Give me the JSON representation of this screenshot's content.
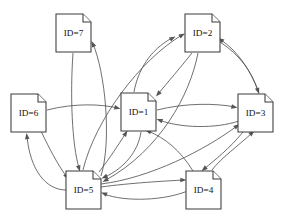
{
  "diagram": {
    "background_color": "#ffffff",
    "node_fill": "#ffffff",
    "node_stroke": "#3a3a3a",
    "edge_stroke": "#555555",
    "label_color": "#111111",
    "node_shape": "document-page-with-folded-corner",
    "width": 282,
    "height": 222,
    "nodes": [
      {
        "id": "7",
        "label": "ID=7",
        "x": 56,
        "y": 14,
        "w": 35,
        "h": 38
      },
      {
        "id": "2",
        "label": "ID=2",
        "x": 185,
        "y": 14,
        "w": 35,
        "h": 38
      },
      {
        "id": "6",
        "label": "ID=6",
        "x": 11,
        "y": 94,
        "w": 35,
        "h": 38
      },
      {
        "id": "1",
        "label": "ID=1",
        "x": 121,
        "y": 93,
        "w": 35,
        "h": 38
      },
      {
        "id": "3",
        "label": "ID=3",
        "x": 238,
        "y": 94,
        "w": 35,
        "h": 38
      },
      {
        "id": "5",
        "label": "ID=5",
        "x": 66,
        "y": 171,
        "w": 35,
        "h": 38
      },
      {
        "id": "4",
        "label": "ID=4",
        "x": 186,
        "y": 171,
        "w": 35,
        "h": 38
      }
    ],
    "edges": [
      {
        "from": "6",
        "to": "1",
        "path": "M 47,110 C 75,103 100,104 118,108",
        "arrow_at": [
          120.5,
          108.8
        ],
        "arrow_angle": 14
      },
      {
        "from": "6",
        "to": "5",
        "path": "M 41,131 C 50,150 57,163 66,176",
        "arrow_at": [
          68.5,
          179.5
        ],
        "arrow_angle": 57
      },
      {
        "from": "5",
        "to": "6",
        "path": "M 66,190 C 46,190 30,170 27,136",
        "arrow_at": [
          26.5,
          133
        ],
        "arrow_angle": -97
      },
      {
        "from": "7",
        "to": "5",
        "path": "M 73,53 C 70,95 72,145 79,168",
        "arrow_at": [
          80,
          171.5
        ],
        "arrow_angle": 73
      },
      {
        "from": "5",
        "to": "7",
        "path": "M 101,176 C 112,140 105,72 93,44",
        "arrow_at": [
          91.5,
          41
        ],
        "arrow_angle": -115
      },
      {
        "from": "5",
        "to": "1",
        "path": "M 99,172 C 110,158 118,145 126,133",
        "arrow_at": [
          127.5,
          130.5
        ],
        "arrow_angle": -57
      },
      {
        "from": "1",
        "to": "5",
        "path": "M 141,132 C 138,152 124,168 105,177",
        "arrow_at": [
          101.5,
          178.5
        ],
        "arrow_angle": 155
      },
      {
        "from": "1",
        "to": "2",
        "path": "M 134,92 C 138,70 150,50 172,38",
        "arrow_at": [
          175.5,
          36.5
        ],
        "arrow_angle": -28
      },
      {
        "from": "2",
        "to": "1",
        "path": "M 192,53 C 180,68 168,82 158,94",
        "arrow_at": [
          156,
          96.5
        ],
        "arrow_angle": 130
      },
      {
        "from": "5",
        "to": "2",
        "path": "M 83,170 C 95,120 140,60 182,35",
        "arrow_at": [
          185,
          33.5
        ],
        "arrow_angle": -28
      },
      {
        "from": "2",
        "to": "5",
        "path": "M 198,53 C 190,95 160,150 106,180",
        "arrow_at": [
          102.5,
          182
        ],
        "arrow_angle": 150
      },
      {
        "from": "1",
        "to": "3",
        "path": "M 157,110 C 185,103 215,103 235,107",
        "arrow_at": [
          237.5,
          107.8
        ],
        "arrow_angle": 13
      },
      {
        "from": "3",
        "to": "1",
        "path": "M 239,121 C 215,129 180,128 159,120",
        "arrow_at": [
          156.5,
          119
        ],
        "arrow_angle": -160
      },
      {
        "from": "3",
        "to": "2",
        "path": "M 259,93 C 250,68 236,50 221,40",
        "arrow_at": [
          218,
          38
        ],
        "arrow_angle": -146
      },
      {
        "from": "2",
        "to": "3",
        "path": "M 220,42 C 240,55 252,72 258,91",
        "arrow_at": [
          259,
          94
        ],
        "arrow_angle": 72
      },
      {
        "from": "5",
        "to": "3",
        "path": "M 101,184 C 150,178 205,150 237,126",
        "arrow_at": [
          239.5,
          124
        ],
        "arrow_angle": -37
      },
      {
        "from": "3",
        "to": "4",
        "path": "M 243,132 C 230,148 215,160 204,169",
        "arrow_at": [
          201.5,
          171
        ],
        "arrow_angle": 141
      },
      {
        "from": "4",
        "to": "3",
        "path": "M 212,170 C 221,158 238,146 252,133",
        "arrow_at": [
          254.5,
          130.5
        ],
        "arrow_angle": -43
      },
      {
        "from": "5",
        "to": "4",
        "path": "M 101,187 C 130,183 165,181 184,180",
        "arrow_at": [
          186.5,
          180
        ],
        "arrow_angle": 0
      },
      {
        "from": "4",
        "to": "5",
        "path": "M 190,190 C 165,201 125,202 104,194",
        "arrow_at": [
          101,
          192.5
        ],
        "arrow_angle": -160
      },
      {
        "from": "4",
        "to": "1",
        "path": "M 193,171 C 180,150 165,138 148,131",
        "arrow_at": [
          145,
          130
        ],
        "arrow_angle": -160
      }
    ]
  }
}
